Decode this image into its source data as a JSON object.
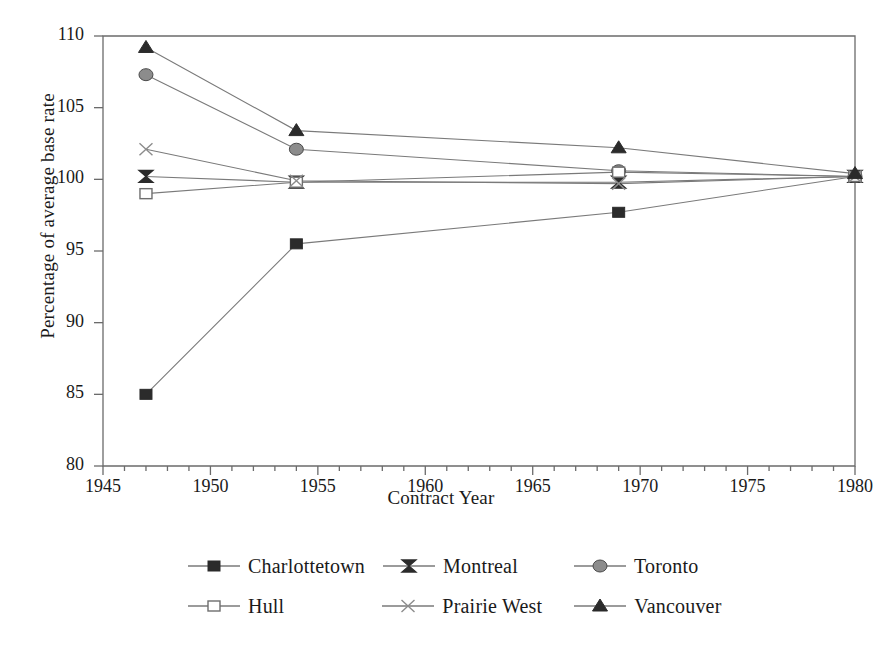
{
  "chart_data": {
    "type": "line",
    "title": "",
    "xlabel": "Contract Year",
    "ylabel": "Percentage of average base rate",
    "xlim": [
      1945,
      1980
    ],
    "ylim": [
      80,
      110
    ],
    "xticks": [
      1945,
      1950,
      1955,
      1960,
      1965,
      1970,
      1975,
      1980
    ],
    "yticks": [
      80,
      85,
      90,
      95,
      100,
      105,
      110
    ],
    "xtick_labels": [
      "1945",
      "1950",
      "1955",
      "1960",
      "1965",
      "1970",
      "1975",
      "1980"
    ],
    "ytick_labels": [
      "80",
      "85",
      "90",
      "95",
      "100",
      "105",
      "110"
    ],
    "minor_xtick_interval": 1,
    "grid": false,
    "legend_position": "bottom",
    "x": [
      1947,
      1954,
      1969,
      1980
    ],
    "series": [
      {
        "name": "Charlottetown",
        "marker": "filled-square",
        "color": "#2b2b2b",
        "values": [
          85.0,
          95.5,
          97.7,
          100.2
        ]
      },
      {
        "name": "Montreal",
        "marker": "bowtie",
        "color": "#2b2b2b",
        "values": [
          100.2,
          99.8,
          99.8,
          100.2
        ]
      },
      {
        "name": "Toronto",
        "marker": "filled-circle",
        "color": "#8c8c8c",
        "values": [
          107.3,
          102.1,
          100.6,
          100.2
        ]
      },
      {
        "name": "Hull",
        "marker": "open-square",
        "color": "#6e6e6e",
        "values": [
          99.0,
          99.8,
          100.5,
          100.2
        ]
      },
      {
        "name": "Prairie West",
        "marker": "cross-x",
        "color": "#8c8c8c",
        "values": [
          102.1,
          99.9,
          99.7,
          100.2
        ]
      },
      {
        "name": "Vancouver",
        "marker": "filled-triangle",
        "color": "#2b2b2b",
        "values": [
          109.2,
          103.4,
          102.2,
          100.4
        ]
      }
    ]
  },
  "legend": {
    "rows": [
      [
        {
          "label": "Charlottetown",
          "marker": "filled-square",
          "color": "#2b2b2b"
        },
        {
          "label": "Montreal",
          "marker": "bowtie",
          "color": "#2b2b2b"
        },
        {
          "label": "Toronto",
          "marker": "filled-circle",
          "color": "#8c8c8c"
        }
      ],
      [
        {
          "label": "Hull",
          "marker": "open-square",
          "color": "#6e6e6e"
        },
        {
          "label": "Prairie West",
          "marker": "cross-x",
          "color": "#8c8c8c"
        },
        {
          "label": "Vancouver",
          "marker": "filled-triangle",
          "color": "#2b2b2b"
        }
      ]
    ]
  },
  "colors": {
    "axis": "#6b6b6b",
    "line": "#7a7a7a",
    "text": "#1a1a1a",
    "background": "#ffffff"
  }
}
